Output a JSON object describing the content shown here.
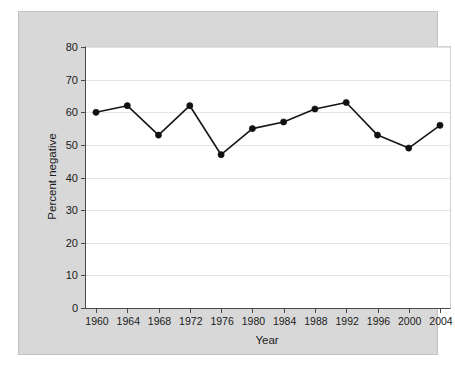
{
  "chart_data": {
    "type": "line",
    "title": "",
    "subtitle": "",
    "xlabel": "Year",
    "ylabel": "Percent negative",
    "categories": [
      1960,
      1964,
      1968,
      1972,
      1976,
      1980,
      1984,
      1988,
      1992,
      1996,
      2000,
      2004
    ],
    "xtick_labels": [
      "1960",
      "1964",
      "1968",
      "1972",
      "1976",
      "1980",
      "1984",
      "1988",
      "1992",
      "1996",
      "2000",
      "2004"
    ],
    "values": [
      60,
      62,
      53,
      62,
      47,
      55,
      57,
      61,
      63,
      53,
      49,
      56
    ],
    "series": [
      {
        "name": "Percent negative",
        "values": [
          60,
          62,
          53,
          62,
          47,
          55,
          57,
          61,
          63,
          53,
          49,
          56
        ]
      }
    ],
    "ylim": [
      0,
      80
    ],
    "xlim": [
      1960,
      2004
    ],
    "ytick_labels": [
      "0",
      "10",
      "20",
      "30",
      "40",
      "50",
      "60",
      "70",
      "80"
    ],
    "yticks": [
      0,
      10,
      20,
      30,
      40,
      50,
      60,
      70,
      80
    ],
    "grid": "horizontal",
    "legend": "none",
    "marker": "filled-circle",
    "colors": {
      "line": "#161616",
      "marker": "#111111",
      "gridline": "#e4e4e4",
      "plot_background": "#ffffff",
      "figure_background": "#d8d8d8",
      "page_background": "#ffffff",
      "axis": "#4a4a4a",
      "text": "#1a1a1a"
    }
  }
}
